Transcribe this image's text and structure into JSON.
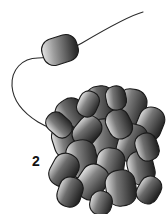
{
  "figure": {
    "label": "2",
    "label_position": {
      "x": 32,
      "y": 154
    },
    "background_color": "#ffffff",
    "outline_color": "#1a1a1a",
    "gradient_light": "#ededed",
    "gradient_mid": "#9a9a9a",
    "gradient_dark": "#2e2e2e",
    "title": "",
    "free_cell": {
      "name": "single rod-shaped bacterium",
      "center": {
        "x": 60,
        "y": 50
      },
      "width": 36,
      "height": 27,
      "rotation_deg": -18,
      "corner_radius": 11
    },
    "flagellum": {
      "name": "flagellum",
      "stroke_width": 1.1,
      "stroke_color": "#2a2a2a",
      "path": "M143,12 C128,16 104,30 82,43 C66,52 52,58 38,58 C22,58 11,70 12,86 C13,100 22,112 38,122 C48,128 58,131 68,133"
    },
    "cluster": {
      "name": "bacterial cell cluster",
      "bounds": {
        "x": 52,
        "y": 90,
        "width": 108,
        "height": 118
      },
      "cell_count": 22,
      "cells": [
        {
          "cx": 101,
          "cy": 106,
          "rx": 15,
          "ry": 20,
          "rot": -8,
          "r": 13,
          "g0": "#f0f0f0",
          "g1": "#6a6a6a",
          "g2": "#262626"
        },
        {
          "cx": 131,
          "cy": 108,
          "rx": 15,
          "ry": 19,
          "rot": 10,
          "r": 13,
          "g0": "#e8e8e8",
          "g1": "#7a7a7a",
          "g2": "#2a2a2a"
        },
        {
          "cx": 73,
          "cy": 117,
          "rx": 15,
          "ry": 19,
          "rot": -34,
          "r": 13,
          "g0": "#efefef",
          "g1": "#6e6e6e",
          "g2": "#242424"
        },
        {
          "cx": 150,
          "cy": 124,
          "rx": 13,
          "ry": 17,
          "rot": 22,
          "r": 12,
          "g0": "#e4e4e4",
          "g1": "#757575",
          "g2": "#282828"
        },
        {
          "cx": 104,
          "cy": 140,
          "rx": 16,
          "ry": 21,
          "rot": -6,
          "r": 14,
          "g0": "#f2f2f2",
          "g1": "#828282",
          "g2": "#303030"
        },
        {
          "cx": 132,
          "cy": 143,
          "rx": 14,
          "ry": 19,
          "rot": 16,
          "r": 12,
          "g0": "#e6e6e6",
          "g1": "#6b6b6b",
          "g2": "#222222"
        },
        {
          "cx": 66,
          "cy": 141,
          "rx": 13,
          "ry": 17,
          "rot": -18,
          "r": 12,
          "g0": "#ededed",
          "g1": "#7d7d7d",
          "g2": "#2c2c2c"
        },
        {
          "cx": 87,
          "cy": 131,
          "rx": 12,
          "ry": 16,
          "rot": 40,
          "r": 11,
          "g0": "#e0e0e0",
          "g1": "#6f6f6f",
          "g2": "#252525"
        },
        {
          "cx": 119,
          "cy": 124,
          "rx": 12,
          "ry": 15,
          "rot": -26,
          "r": 11,
          "g0": "#eaeaea",
          "g1": "#787878",
          "g2": "#2b2b2b"
        },
        {
          "cx": 82,
          "cy": 159,
          "rx": 15,
          "ry": 19,
          "rot": -12,
          "r": 13,
          "g0": "#f0f0f0",
          "g1": "#808080",
          "g2": "#2e2e2e"
        },
        {
          "cx": 64,
          "cy": 170,
          "rx": 13,
          "ry": 17,
          "rot": 28,
          "r": 12,
          "g0": "#e3e3e3",
          "g1": "#6c6c6c",
          "g2": "#232323"
        },
        {
          "cx": 110,
          "cy": 166,
          "rx": 14,
          "ry": 18,
          "rot": 8,
          "r": 12,
          "g0": "#ececec",
          "g1": "#7b7b7b",
          "g2": "#2a2a2a"
        },
        {
          "cx": 141,
          "cy": 168,
          "rx": 13,
          "ry": 17,
          "rot": -14,
          "r": 12,
          "g0": "#e6e6e6",
          "g1": "#727272",
          "g2": "#262626"
        },
        {
          "cx": 92,
          "cy": 182,
          "rx": 14,
          "ry": 18,
          "rot": 34,
          "r": 12,
          "g0": "#efefef",
          "g1": "#858585",
          "g2": "#313131"
        },
        {
          "cx": 121,
          "cy": 188,
          "rx": 15,
          "ry": 18,
          "rot": -10,
          "r": 13,
          "g0": "#e9e9e9",
          "g1": "#767676",
          "g2": "#272727"
        },
        {
          "cx": 70,
          "cy": 192,
          "rx": 12,
          "ry": 15,
          "rot": 18,
          "r": 11,
          "g0": "#e2e2e2",
          "g1": "#6d6d6d",
          "g2": "#242424"
        },
        {
          "cx": 149,
          "cy": 190,
          "rx": 11,
          "ry": 14,
          "rot": 30,
          "r": 10,
          "g0": "#dedede",
          "g1": "#6a6a6a",
          "g2": "#222222"
        },
        {
          "cx": 59,
          "cy": 125,
          "rx": 10,
          "ry": 14,
          "rot": -48,
          "r": 9,
          "g0": "#e7e7e7",
          "g1": "#7c7c7c",
          "g2": "#2d2d2d"
        },
        {
          "cx": 147,
          "cy": 147,
          "rx": 11,
          "ry": 14,
          "rot": -20,
          "r": 10,
          "g0": "#e1e1e1",
          "g1": "#6e6e6e",
          "g2": "#252525"
        },
        {
          "cx": 88,
          "cy": 104,
          "rx": 10,
          "ry": 13,
          "rot": 24,
          "r": 9,
          "g0": "#eeeeee",
          "g1": "#838383",
          "g2": "#2f2f2f"
        },
        {
          "cx": 116,
          "cy": 98,
          "rx": 10,
          "ry": 12,
          "rot": -12,
          "r": 9,
          "g0": "#e5e5e5",
          "g1": "#737373",
          "g2": "#262626"
        },
        {
          "cx": 101,
          "cy": 203,
          "rx": 11,
          "ry": 12,
          "rot": 12,
          "r": 10,
          "g0": "#e8e8e8",
          "g1": "#7a7a7a",
          "g2": "#2a2a2a"
        }
      ]
    }
  }
}
